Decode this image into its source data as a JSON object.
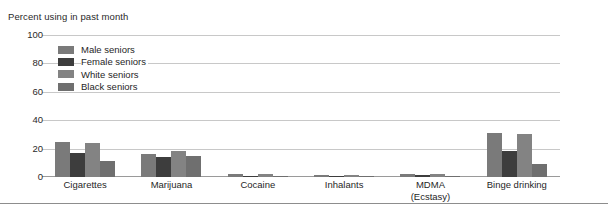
{
  "chart_data": {
    "type": "bar",
    "title": "",
    "ylabel": "Percent using in past month",
    "xlabel": "",
    "ylim": [
      0,
      100
    ],
    "yticks": [
      0,
      20,
      40,
      60,
      80,
      100
    ],
    "grid": true,
    "legend_position": "inside-top-left",
    "categories": [
      "Cigarettes",
      "Marijuana",
      "Cocaine",
      "Inhalants",
      "MDMA (Ecstasy)",
      "Binge drinking"
    ],
    "category_lines": [
      [
        "Cigarettes",
        ""
      ],
      [
        "Marijuana",
        ""
      ],
      [
        "Cocaine",
        ""
      ],
      [
        "Inhalants",
        ""
      ],
      [
        "MDMA",
        "(Ecstasy)"
      ],
      [
        "Binge drinking",
        ""
      ]
    ],
    "series": [
      {
        "name": "Male seniors",
        "color": "#7a7a7a",
        "values": [
          25,
          16,
          2,
          1.5,
          2,
          31
        ]
      },
      {
        "name": "Female seniors",
        "color": "#3d3d3d",
        "values": [
          17,
          14,
          1,
          1,
          1.5,
          18
        ]
      },
      {
        "name": "White seniors",
        "color": "#838383",
        "values": [
          24,
          18,
          2,
          1.5,
          2,
          30
        ]
      },
      {
        "name": "Black seniors",
        "color": "#6f6f6f",
        "values": [
          11,
          15,
          1,
          1,
          1,
          9
        ]
      }
    ]
  },
  "colors": {
    "gridline": "#c8c8c8",
    "baseline": "#9a9a9a",
    "bottom_rule": "#8d8d8d",
    "text": "#1f1f1f",
    "background": "#ffffff"
  }
}
